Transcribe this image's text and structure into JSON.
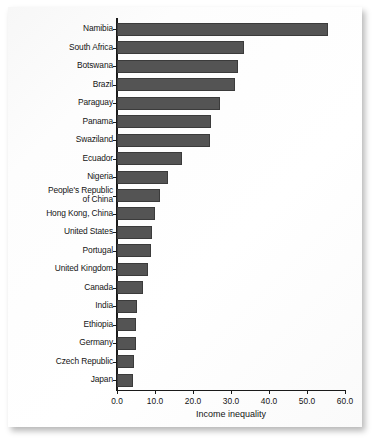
{
  "chart_data": {
    "type": "bar",
    "orientation": "horizontal",
    "title": "",
    "xlabel": "Income inequality",
    "ylabel": "",
    "xlim": [
      0.0,
      60.0
    ],
    "xticks": [
      "0.0",
      "10.0",
      "20.0",
      "30.0",
      "40.0",
      "50.0",
      "60.0"
    ],
    "xtick_values": [
      0,
      10,
      20,
      30,
      40,
      50,
      60
    ],
    "grid": false,
    "legend": null,
    "bar_color": "#545454",
    "axis_color": "#1a1a1a",
    "categories": [
      "Namibia",
      "South Africa",
      "Botswana",
      "Brazil",
      "Paraguay",
      "Panama",
      "Swaziland",
      "Ecuador",
      "Nigeria",
      "People's Republic\nof China",
      "Hong Kong, China",
      "United States",
      "Portugal",
      "United Kingdom",
      "Canada",
      "India",
      "Ethiopia",
      "Germany",
      "Czech Republic",
      "Japan"
    ],
    "values": [
      55.5,
      33.4,
      31.8,
      31.0,
      27.2,
      24.8,
      24.5,
      17.2,
      13.4,
      11.3,
      10.0,
      9.2,
      8.9,
      8.2,
      6.8,
      5.3,
      5.0,
      5.0,
      4.4,
      4.3
    ]
  }
}
